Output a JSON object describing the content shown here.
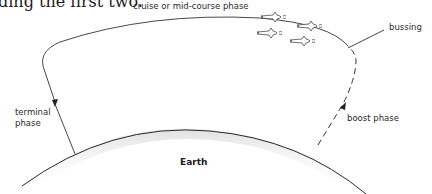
{
  "figure": {
    "cut_text": "ding the first two.",
    "labels": {
      "cruise": "cruise or mid-course phase",
      "bussing": "bussing",
      "terminal_line1": "terminal",
      "terminal_line2": "phase",
      "boost": "boost phase",
      "earth": "Earth"
    },
    "icons": [
      "missile-icon",
      "missile-icon",
      "missile-icon",
      "missile-icon"
    ],
    "colors": {
      "line": "#2a2a2a",
      "earth_shadow": "#d8d8d8"
    }
  }
}
